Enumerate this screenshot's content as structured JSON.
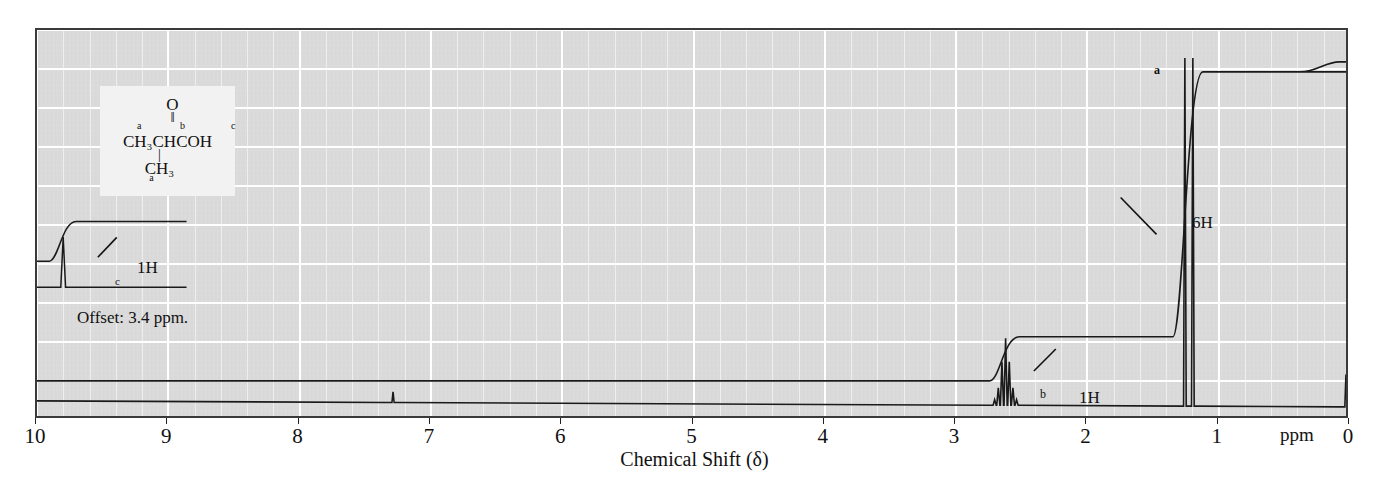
{
  "figure": {
    "type": "nmr-spectrum",
    "xtitle": "Chemical Shift (δ)",
    "ppm_unit": "ppm",
    "offset_note": "Offset: 3.4 ppm."
  },
  "structure": {
    "oxygen": "O",
    "double_bond": "‖",
    "label_a": "a",
    "label_b": "b",
    "label_c": "c",
    "main_chain": "CH₃CHCOH",
    "vertical_bond": "|",
    "branch": "CH₃",
    "branch_label": "a"
  },
  "annotations": {
    "peak_a_label": "a",
    "peak_a_integration": "6H",
    "peak_b_label": "b",
    "peak_b_integration": "1H",
    "peak_c_label": "c",
    "peak_c_integration": "1H"
  },
  "axis": {
    "ticks": [
      "10",
      "9",
      "8",
      "7",
      "6",
      "5",
      "4",
      "3",
      "2",
      "1",
      "0"
    ],
    "min": 0,
    "max": 10,
    "direction": "reversed"
  },
  "colors": {
    "plot_background": "#d9d9d9",
    "grid": "#ffffff",
    "trace": "#1a1a1a",
    "frame": "#3a3a3a",
    "structure_background": "#f2f2f2"
  },
  "chart_data": {
    "type": "line",
    "title": "",
    "xlabel": "Chemical Shift (δ)",
    "ylabel": "",
    "xlim": [
      10,
      0
    ],
    "ylim": [
      0,
      100
    ],
    "grid": true,
    "legend": "none",
    "series": [
      {
        "name": "spectrum",
        "peaks": [
          {
            "label": "c",
            "shift_ppm": 9.8,
            "assignment": "COOH",
            "integration_H": 1,
            "multiplicity": "singlet",
            "height_rel": 14,
            "offset_ppm": 3.4
          },
          {
            "label": "impurity",
            "shift_ppm": 7.28,
            "assignment": "CHCl3",
            "integration_H": 0,
            "multiplicity": "singlet",
            "height_rel": 3
          },
          {
            "label": "b",
            "shift_ppm": 2.6,
            "assignment": "CH",
            "integration_H": 1,
            "multiplicity": "septet",
            "height_rel": 22
          },
          {
            "label": "a",
            "shift_ppm": 1.2,
            "assignment": "CH3 (x2)",
            "integration_H": 6,
            "multiplicity": "doublet",
            "height_rel": 97
          },
          {
            "label": "TMS",
            "shift_ppm": 0.0,
            "assignment": "TMS reference",
            "integration_H": 0,
            "multiplicity": "singlet",
            "height_rel": 9
          }
        ]
      },
      {
        "name": "integration",
        "steps": [
          {
            "shift_ppm": 2.6,
            "rise_rel": 1
          },
          {
            "shift_ppm": 1.2,
            "rise_rel": 6
          },
          {
            "shift_ppm": 0.0,
            "rise_rel": 0
          }
        ]
      }
    ]
  }
}
